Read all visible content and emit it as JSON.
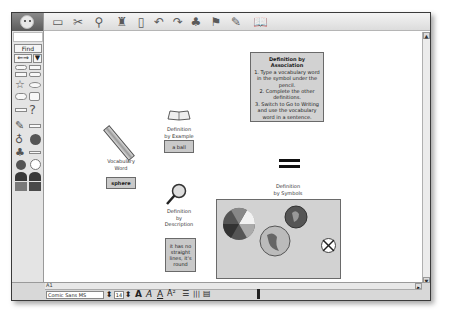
{
  "top_toolbar": {
    "app_logo": "app-logo-face",
    "icons": [
      {
        "name": "new-card-icon",
        "glyph": "▭"
      },
      {
        "name": "cut-scissors-icon",
        "glyph": "✂"
      },
      {
        "name": "link-icon",
        "glyph": "⚲"
      },
      {
        "name": "paint-bucket-icon",
        "glyph": "♜"
      },
      {
        "name": "eraser-icon",
        "glyph": "▯"
      },
      {
        "name": "undo-icon",
        "glyph": "↶"
      },
      {
        "name": "redo-icon",
        "glyph": "↷"
      },
      {
        "name": "idea-bulb-icon",
        "glyph": "♣"
      },
      {
        "name": "flag-icon",
        "glyph": "⚑"
      },
      {
        "name": "pencil-icon",
        "glyph": "✎"
      },
      {
        "name": "book-search-icon",
        "glyph": "📖"
      }
    ]
  },
  "left_toolbar": {
    "find_label": "Find",
    "nav_arrows": "⇐⇒",
    "dropdown": "▼",
    "glyphs": {
      "star": "☆",
      "question": "?",
      "pencil": "✎",
      "bulb": "♁",
      "tree": "♣",
      "clock": "◴",
      "person1": "☻",
      "person2": "☻"
    }
  },
  "canvas": {
    "vocabulary_label": "Vocabulary\nWord",
    "vocabulary_value": "sphere",
    "example_label": "Definition\nby Example",
    "example_value": "a ball",
    "description_label": "Definition\nby\nDescription",
    "description_value": "it has no straight lines, it's round",
    "symbols_label": "Definition\nby Symbols",
    "instructions": {
      "title": "Definition by Association",
      "step1": "1. Type a vocabulary word in the symbol under the pencil.",
      "step2": "2. Complete the other definitions.",
      "step3": "3. Switch to Go to Writing and use the vocabulary word in a sentence."
    }
  },
  "bottom_bar": {
    "zoom_label": "A1",
    "font_name": "Comic Sans MS",
    "font_size": "14",
    "format_buttons": [
      "A",
      "A",
      "A",
      "A²"
    ],
    "align_glyphs": [
      "☰",
      "|||",
      "▤"
    ]
  }
}
